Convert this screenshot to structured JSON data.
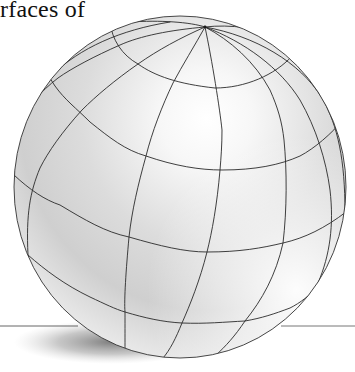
{
  "caption": {
    "text": "rfaces of"
  },
  "figure": {
    "colors": {
      "background": "#ffffff",
      "sphere_highlight": "#ffffff",
      "sphere_mid": "#e2e2e2",
      "sphere_shadow": "#b8b8b8",
      "grid_line": "#2a2a2a",
      "ground_line": "#555555",
      "cast_shadow": "#8a8a8a"
    }
  }
}
